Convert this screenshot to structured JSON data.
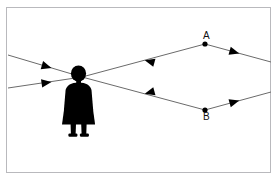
{
  "figure": {
    "kind": "optics-ray-diagram",
    "title": "",
    "background_color": "#ffffff",
    "frame": {
      "border_color": "#b9b9bd",
      "border_width_px": 1,
      "x": 6,
      "y": 7,
      "width": 265,
      "height": 166
    },
    "line_color": "#6b6b6b",
    "line_width_px": 1,
    "ink_color": "#000000"
  },
  "observer": {
    "name": "person-silhouette",
    "description": "Standing human figure shown as a solid black silhouette, facing viewer, wearing a skirt",
    "fill_color": "#000000",
    "eye_point": {
      "x": 82,
      "y": 77
    },
    "bounds": {
      "x": 62,
      "y": 66,
      "width": 33,
      "height": 71
    }
  },
  "points": [
    {
      "id": "A",
      "label": "A",
      "x": 205,
      "y": 44,
      "dot_radius_px": 2.6,
      "dot_color": "#000000",
      "label_position": "above"
    },
    {
      "id": "B",
      "label": "B",
      "x": 205,
      "y": 110,
      "dot_radius_px": 2.6,
      "dot_color": "#000000",
      "label_position": "below"
    }
  ],
  "rays": [
    {
      "id": "incoming-upper",
      "description": "Ray arriving from the upper left toward the observer's eye",
      "from": {
        "x": 8,
        "y": 55
      },
      "to": {
        "x": 82,
        "y": 77
      },
      "arrowheads": [
        {
          "at_fraction": 0.56,
          "direction": "right",
          "target": "observer-eye"
        }
      ]
    },
    {
      "id": "incoming-lower",
      "description": "Ray arriving from the lower left toward the observer's eye",
      "from": {
        "x": 8,
        "y": 88
      },
      "to": {
        "x": 82,
        "y": 77
      },
      "arrowheads": [
        {
          "at_fraction": 0.56,
          "direction": "right",
          "target": "observer-eye"
        }
      ]
    },
    {
      "id": "A-to-eye",
      "description": "Ray from point A traveling left into the observer's eye",
      "from": {
        "x": 205,
        "y": 44
      },
      "to": {
        "x": 82,
        "y": 77
      },
      "arrowheads": [
        {
          "at_fraction": 0.49,
          "direction": "left",
          "target": "observer-eye"
        }
      ]
    },
    {
      "id": "B-to-eye",
      "description": "Ray from point B traveling left into the observer's eye",
      "from": {
        "x": 205,
        "y": 110
      },
      "to": {
        "x": 82,
        "y": 77
      },
      "arrowheads": [
        {
          "at_fraction": 0.49,
          "direction": "left",
          "target": "observer-eye"
        }
      ]
    },
    {
      "id": "A-outgoing",
      "description": "Ray continuing from point A down and to the right, off the frame edge",
      "from": {
        "x": 205,
        "y": 44
      },
      "to": {
        "x": 271,
        "y": 62
      },
      "arrowheads": [
        {
          "at_fraction": 0.52,
          "direction": "right-down",
          "target": "off-frame-right"
        }
      ]
    },
    {
      "id": "B-outgoing",
      "description": "Ray continuing from point B up and to the right, off the frame edge",
      "from": {
        "x": 205,
        "y": 110
      },
      "to": {
        "x": 271,
        "y": 92
      },
      "arrowheads": [
        {
          "at_fraction": 0.52,
          "direction": "right-up",
          "target": "off-frame-right"
        }
      ]
    }
  ],
  "arrow": {
    "fill_color": "#000000",
    "length_px": 9,
    "half_width_px": 4
  }
}
